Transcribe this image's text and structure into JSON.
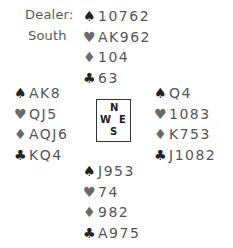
{
  "dealer": {
    "label": "Dealer:",
    "value": "South"
  },
  "icons": {
    "spade": "♠",
    "heart": "♥",
    "diamond": "♦",
    "club": "♣"
  },
  "hands": {
    "north": {
      "spades": "10762",
      "hearts": "AK962",
      "diamonds": "104",
      "clubs": "63"
    },
    "west": {
      "spades": "AK8",
      "hearts": "QJ5",
      "diamonds": "AQJ6",
      "clubs": "KQ4"
    },
    "east": {
      "spades": "Q4",
      "hearts": "1083",
      "diamonds": "K753",
      "clubs": "J1082"
    },
    "south": {
      "spades": "J953",
      "hearts": "74",
      "diamonds": "982",
      "clubs": "A975"
    }
  },
  "compass": {
    "n": "N",
    "w": "W",
    "e": "E",
    "s": "S"
  }
}
